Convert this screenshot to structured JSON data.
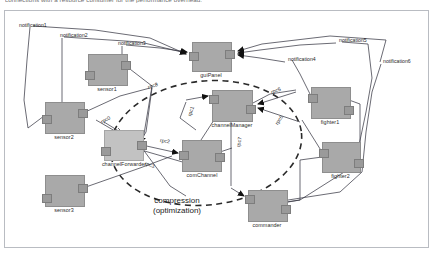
{
  "caption": "connections with a resource consumer for the performance overhead.",
  "diagram": {
    "annotation": {
      "line1": "compression",
      "line2": "(optimization)"
    },
    "nodes": [
      {
        "id": "sensor1",
        "label": "sensor1",
        "x": 88,
        "y": 54,
        "w": 38,
        "h": 30,
        "shade": "dark"
      },
      {
        "id": "sensor2",
        "label": "sensor2",
        "x": 45,
        "y": 102,
        "w": 38,
        "h": 30,
        "shade": "dark"
      },
      {
        "id": "sensor3",
        "label": "sensor3",
        "x": 45,
        "y": 175,
        "w": 38,
        "h": 30,
        "shade": "dark"
      },
      {
        "id": "guiPanel",
        "label": "guiPanel",
        "x": 192,
        "y": 42,
        "w": 38,
        "h": 28,
        "shade": "dark"
      },
      {
        "id": "channelManager",
        "label": "channelManager",
        "x": 212,
        "y": 90,
        "w": 39,
        "h": 30,
        "shade": "dark"
      },
      {
        "id": "channelForwarder",
        "label": "channelForwarder",
        "x": 104,
        "y": 130,
        "w": 38,
        "h": 29,
        "shade": "light"
      },
      {
        "id": "comChannel",
        "label": "comChannel",
        "x": 182,
        "y": 140,
        "w": 38,
        "h": 30,
        "shade": "dark"
      },
      {
        "id": "fighter1",
        "label": "fighter1",
        "x": 311,
        "y": 87,
        "w": 38,
        "h": 30,
        "shade": "dark"
      },
      {
        "id": "fighter2",
        "label": "fighter2",
        "x": 322,
        "y": 142,
        "w": 37,
        "h": 29,
        "shade": "dark"
      },
      {
        "id": "commander",
        "label": "commander",
        "x": 248,
        "y": 190,
        "w": 38,
        "h": 30,
        "shade": "dark"
      }
    ],
    "edge_labels": [
      {
        "id": "notification1",
        "label": "notification1",
        "x": 19,
        "y": 22
      },
      {
        "id": "notification2",
        "label": "notification2",
        "x": 60,
        "y": 32
      },
      {
        "id": "notification3",
        "label": "notification3",
        "x": 118,
        "y": 40
      },
      {
        "id": "notification4",
        "label": "notification4",
        "x": 288,
        "y": 57
      },
      {
        "id": "notification5",
        "label": "notification5",
        "x": 339,
        "y": 38
      },
      {
        "id": "notification6",
        "label": "notification6",
        "x": 383,
        "y": 59
      },
      {
        "id": "rpc8",
        "label": "rpc8",
        "x": 148,
        "y": 84
      },
      {
        "id": "rpc0",
        "label": "rpc0",
        "x": 101,
        "y": 119
      },
      {
        "id": "rpc2",
        "label": "rpc2",
        "x": 160,
        "y": 138
      },
      {
        "id": "rpc3",
        "label": "rpc3",
        "x": 157,
        "y": 147
      },
      {
        "id": "rpc1",
        "label": "rpc1",
        "x": 189,
        "y": 115
      },
      {
        "id": "rpc5",
        "label": "rpc5",
        "x": 271,
        "y": 90
      },
      {
        "id": "rpc6",
        "label": "rpc6",
        "x": 276,
        "y": 122
      },
      {
        "id": "rpc7",
        "label": "rpc7",
        "x": 238,
        "y": 145
      }
    ]
  }
}
